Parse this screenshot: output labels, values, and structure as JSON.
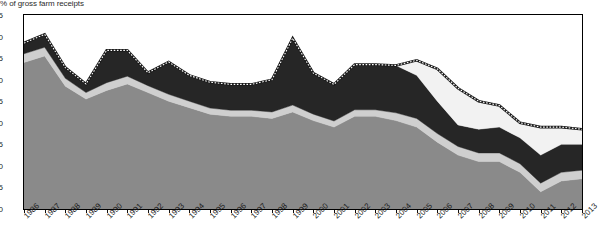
{
  "chart_data": {
    "type": "area",
    "title": "% of gross farm receipts",
    "subtitle": "",
    "xlabel": "",
    "ylabel": "% of gross farm receipts",
    "ylim": [
      0,
      45
    ],
    "ytick_step": 5,
    "yticks": [
      0,
      5,
      10,
      15,
      20,
      25,
      30,
      35,
      40,
      45
    ],
    "grid": false,
    "legend_position": "none",
    "stacked": true,
    "categories": [
      "1986",
      "1987",
      "1988",
      "1989",
      "1990",
      "1991",
      "1992",
      "1993",
      "1994",
      "1995",
      "1996",
      "1997",
      "1998",
      "1999",
      "2000",
      "2001",
      "2002",
      "2003",
      "2004",
      "2005",
      "2006",
      "2007",
      "2008",
      "2009",
      "2010",
      "2011",
      "2012",
      "2013"
    ],
    "series": [
      {
        "name": "series-1-market-price-support",
        "color": "#8a8a8a",
        "values": [
          34.0,
          35.5,
          28.5,
          25.5,
          27.5,
          29.0,
          27.0,
          25.0,
          23.5,
          22.0,
          21.5,
          21.5,
          21.0,
          22.5,
          20.5,
          19.0,
          21.5,
          21.5,
          20.5,
          19.0,
          15.5,
          12.5,
          11.0,
          11.0,
          8.5,
          4.0,
          6.5,
          7.0
        ]
      },
      {
        "name": "series-2-payments-output",
        "color": "#cfcfcf",
        "values": [
          2.0,
          2.0,
          1.8,
          1.5,
          1.8,
          1.8,
          1.6,
          1.6,
          1.5,
          1.4,
          1.4,
          1.4,
          1.5,
          1.6,
          1.5,
          1.4,
          1.5,
          1.5,
          1.8,
          2.0,
          2.0,
          2.0,
          2.0,
          2.0,
          2.0,
          2.0,
          2.0,
          2.0
        ]
      },
      {
        "name": "series-3-other-support",
        "color": "#262626",
        "values": [
          2.5,
          3.0,
          2.5,
          2.0,
          7.5,
          6.0,
          3.0,
          7.5,
          6.0,
          6.0,
          6.0,
          6.0,
          7.5,
          15.5,
          9.5,
          8.5,
          10.5,
          10.5,
          11.0,
          10.0,
          7.5,
          5.0,
          5.5,
          6.0,
          6.0,
          6.5,
          6.5,
          6.0
        ]
      },
      {
        "name": "series-4-budgetary-payments",
        "color": "#f2f2f2",
        "values": [
          0.0,
          0.0,
          0.0,
          0.0,
          0.0,
          0.0,
          0.0,
          0.0,
          0.0,
          0.0,
          0.0,
          0.0,
          0.0,
          0.0,
          0.0,
          0.0,
          0.0,
          0.0,
          0.0,
          3.5,
          7.5,
          8.5,
          6.5,
          5.0,
          3.5,
          6.5,
          4.0,
          3.5
        ]
      }
    ],
    "overlay_line": {
      "name": "total-support-estimate",
      "style": "dotted-checkered",
      "color": "#1a1a1a",
      "values": [
        38.5,
        40.5,
        32.8,
        29.0,
        36.8,
        36.8,
        31.6,
        34.1,
        31.0,
        29.4,
        28.9,
        28.9,
        30.0,
        39.6,
        31.5,
        28.9,
        33.5,
        33.5,
        33.3,
        34.5,
        32.5,
        28.0,
        25.0,
        24.0,
        20.0,
        19.0,
        19.0,
        18.5
      ]
    }
  }
}
